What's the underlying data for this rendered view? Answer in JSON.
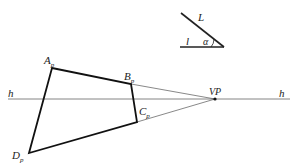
{
  "figure": {
    "top_clipped_text": "",
    "angle_diagram": {
      "label_L": "L",
      "label_l": "l",
      "label_alpha": "α"
    },
    "perspective": {
      "horizon_label_left": "h",
      "horizon_label_right": "h",
      "vanishing_point_label": "VP",
      "points": [
        {
          "name": "A",
          "sub": "p"
        },
        {
          "name": "B",
          "sub": "p"
        },
        {
          "name": "C",
          "sub": "p"
        },
        {
          "name": "D",
          "sub": "p"
        }
      ]
    }
  }
}
